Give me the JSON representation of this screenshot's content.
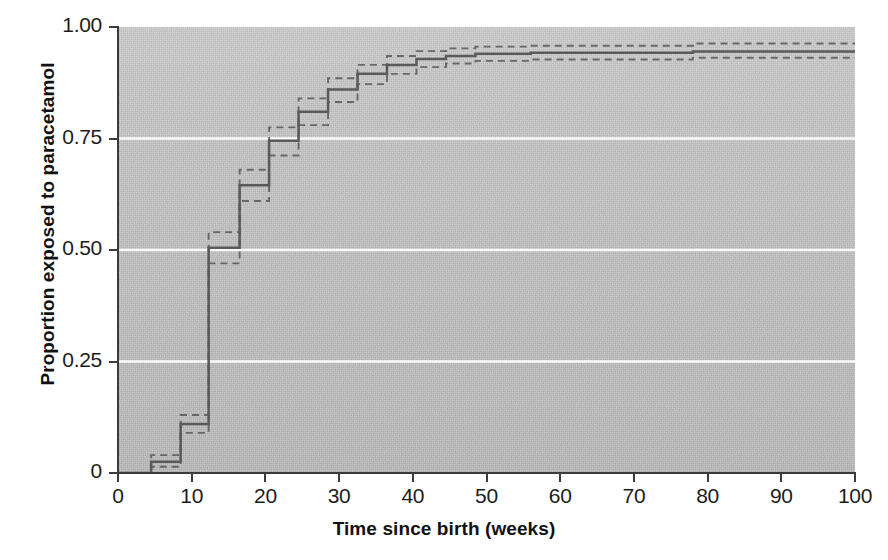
{
  "chart_data": {
    "type": "line",
    "title": "",
    "xlabel": "Time since birth (weeks)",
    "ylabel": "Proportion exposed to paracetamol",
    "xlim": [
      0,
      100
    ],
    "ylim": [
      0,
      1.0
    ],
    "xticks": [
      0,
      10,
      20,
      30,
      40,
      50,
      60,
      70,
      80,
      90,
      100
    ],
    "xticklabels": [
      "0",
      "10",
      "20",
      "30",
      "40",
      "50",
      "60",
      "70",
      "80",
      "90",
      "100"
    ],
    "yticks": [
      0,
      0.25,
      0.5,
      0.75,
      1.0
    ],
    "yticklabels": [
      "0",
      "0.25",
      "0.50",
      "0.75",
      "1.00"
    ],
    "grid": "horizontal-white-gridlines-at-0.25-0.50-0.75",
    "legend": "none",
    "plot_background": "#c9c9c9",
    "line_color": "#5a5a5a",
    "ci_style": "dashed",
    "interpolation": "step-post",
    "series": [
      {
        "name": "Cumulative proportion exposed (Kaplan-Meier estimate)",
        "style": "solid",
        "x": [
          0,
          4.5,
          8.5,
          12.3,
          16.5,
          20.5,
          24.5,
          28.5,
          32.5,
          36.5,
          40.5,
          44.5,
          48.5,
          56.0,
          78.0,
          100
        ],
        "y": [
          0,
          0.025,
          0.11,
          0.505,
          0.645,
          0.745,
          0.81,
          0.86,
          0.895,
          0.915,
          0.928,
          0.935,
          0.94,
          0.942,
          0.945,
          0.945
        ]
      },
      {
        "name": "95% CI upper limit",
        "style": "dashed",
        "x": [
          0,
          4.5,
          8.5,
          12.3,
          16.5,
          20.5,
          24.5,
          28.5,
          32.5,
          36.5,
          40.5,
          44.5,
          48.5,
          56.0,
          78.0,
          100
        ],
        "y": [
          0,
          0.04,
          0.13,
          0.54,
          0.68,
          0.775,
          0.84,
          0.885,
          0.915,
          0.935,
          0.946,
          0.952,
          0.956,
          0.958,
          0.963,
          0.963
        ]
      },
      {
        "name": "95% CI lower limit",
        "style": "dashed",
        "x": [
          0,
          4.5,
          8.5,
          12.3,
          16.5,
          20.5,
          24.5,
          28.5,
          32.5,
          36.5,
          40.5,
          44.5,
          48.5,
          56.0,
          78.0,
          100
        ],
        "y": [
          0,
          0.014,
          0.09,
          0.47,
          0.61,
          0.712,
          0.78,
          0.832,
          0.872,
          0.895,
          0.91,
          0.918,
          0.924,
          0.927,
          0.931,
          0.931
        ]
      }
    ]
  }
}
